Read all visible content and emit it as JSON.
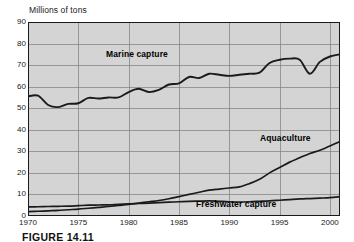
{
  "figure": {
    "caption": "FIGURE 14.11",
    "y_axis_title": "Millions of tons"
  },
  "colors": {
    "plot_background": "#d4d4d4",
    "grid": "#7d7d7d",
    "frame": "#1a1a1a",
    "line": "#1a1a1a",
    "page_background": "#ffffff",
    "text": "#1a1a1a"
  },
  "labels": {
    "marine": "Marine capture",
    "aquaculture": "Aquaculture",
    "freshwater": "Freshwater capture"
  },
  "chart_data": {
    "type": "line",
    "title": "",
    "subtitle": "",
    "xlabel": "",
    "ylabel": "Millions of tons",
    "xlim": [
      1970,
      2001
    ],
    "ylim": [
      0,
      90
    ],
    "ytick_values": [
      0,
      10,
      20,
      30,
      40,
      50,
      60,
      70,
      80,
      90
    ],
    "ytick_labels": [
      "0",
      "10",
      "20",
      "30",
      "40",
      "50",
      "60",
      "70",
      "80",
      "90"
    ],
    "xtick_values": [
      1970,
      1975,
      1980,
      1985,
      1990,
      1995,
      2000
    ],
    "xtick_labels": [
      "1970",
      "1975",
      "1980",
      "1985",
      "1990",
      "1995",
      "2000"
    ],
    "grid": true,
    "grid_axis": "both",
    "legend": "inline-annotations",
    "legend_position": "inline",
    "x": [
      1970,
      1971,
      1972,
      1973,
      1974,
      1975,
      1976,
      1977,
      1978,
      1979,
      1980,
      1981,
      1982,
      1983,
      1984,
      1985,
      1986,
      1987,
      1988,
      1989,
      1990,
      1991,
      1992,
      1993,
      1994,
      1995,
      1996,
      1997,
      1998,
      1999,
      2000,
      2001
    ],
    "series": [
      {
        "name": "Marine capture",
        "values": [
          55.5,
          55.8,
          51.5,
          50.5,
          52.0,
          52.3,
          54.8,
          54.5,
          55.0,
          55.0,
          57.5,
          59.0,
          57.5,
          58.5,
          61.0,
          61.5,
          64.5,
          64.0,
          66.0,
          65.5,
          65.0,
          65.5,
          66.0,
          66.5,
          71.0,
          72.5,
          73.0,
          72.5,
          66.0,
          71.5,
          74.0,
          75.0
        ],
        "label_text": "Marine capture"
      },
      {
        "name": "Aquaculture",
        "values": [
          2.0,
          2.2,
          2.4,
          2.6,
          2.9,
          3.2,
          3.6,
          4.0,
          4.4,
          4.9,
          5.4,
          6.0,
          6.6,
          7.2,
          8.0,
          9.0,
          10.0,
          11.0,
          12.0,
          12.5,
          13.0,
          13.5,
          15.0,
          17.0,
          20.0,
          22.5,
          25.0,
          27.0,
          29.0,
          30.5,
          32.5,
          34.5
        ],
        "label_text": "Aquaculture"
      },
      {
        "name": "Freshwater capture",
        "values": [
          4.2,
          4.3,
          4.4,
          4.5,
          4.6,
          4.8,
          5.0,
          5.1,
          5.2,
          5.4,
          5.6,
          5.8,
          6.0,
          6.2,
          6.4,
          6.6,
          6.8,
          6.9,
          7.0,
          6.8,
          6.6,
          6.5,
          6.6,
          6.8,
          7.0,
          7.3,
          7.6,
          7.9,
          8.1,
          8.3,
          8.5,
          9.0
        ],
        "label_text": "Freshwater capture"
      }
    ]
  }
}
